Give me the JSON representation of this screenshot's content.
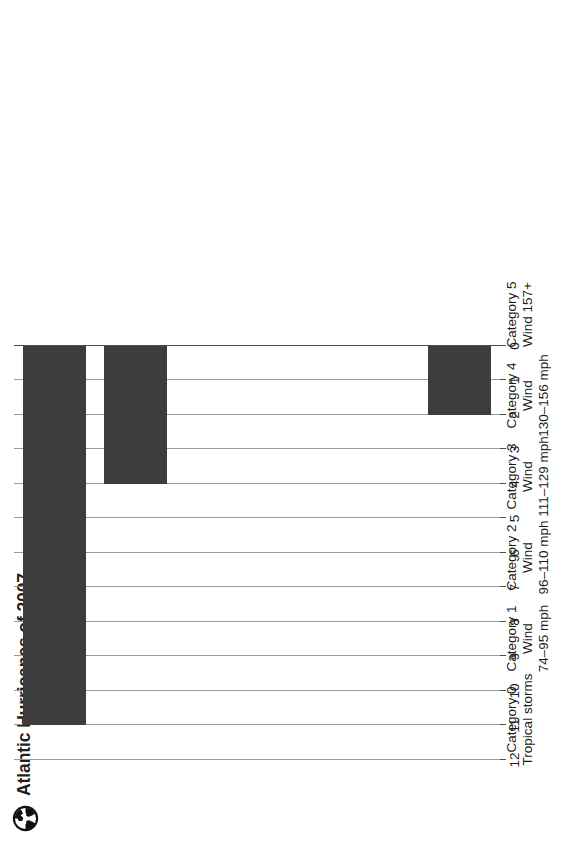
{
  "header": {
    "title": "Atlantic Hurricanes of 2007",
    "logo_icon": "cyclone-icon"
  },
  "chart_data": {
    "type": "bar",
    "orientation": "horizontal",
    "title": "Atlantic Hurricanes of 2007",
    "xlabel": "",
    "ylabel": "",
    "categories": [
      "Category 0 Tropical storms",
      "Category 1 Wind 74–95 mph",
      "Category 2 Wind 96–110 mph",
      "Category 3 Wind 111–129 mph",
      "Category 4 Wind 130–156 mph",
      "Category 5 Wind 157+"
    ],
    "category_lines": [
      [
        "Category 0",
        "Tropical storms"
      ],
      [
        "Category 1",
        "Wind",
        "74–95 mph"
      ],
      [
        "Category 2",
        "Wind",
        "96–110 mph"
      ],
      [
        "Category 3",
        "Wind",
        "111–129 mph"
      ],
      [
        "Category 4",
        "Wind",
        "130–156 mph"
      ],
      [
        "Category 5",
        "Wind 157+"
      ]
    ],
    "values": [
      11,
      4,
      0,
      0,
      0,
      2
    ],
    "ylim": [
      0,
      12
    ],
    "tick_labels": [
      "12",
      "11",
      "10",
      "9",
      "8",
      "7",
      "6",
      "5",
      "4",
      "3",
      "2",
      "1",
      "0"
    ],
    "tick_values": [
      12,
      11,
      10,
      9,
      8,
      7,
      6,
      5,
      4,
      3,
      2,
      1,
      0
    ],
    "axis_reversed": true,
    "grid": true,
    "legend": "none",
    "bar_color": "#3d3d3d",
    "grid_color": "#9a9a9a",
    "background_color": "#ffffff"
  }
}
